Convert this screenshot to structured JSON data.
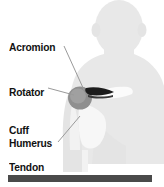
{
  "figure": {
    "background_color": "#ffffff",
    "width": 164,
    "height": 187
  },
  "labels": {
    "acromion": "Acromion",
    "rotator_cuff_tendon_line1": "Rotator",
    "rotator_cuff_tendon_line2": "Cuff",
    "rotator_cuff_tendon_line3": "Tendon",
    "humerus": "Humerus"
  },
  "colors": {
    "text": "#111111",
    "body_silhouette": "#e8e8e8",
    "body_silhouette_shadow": "#dcdcdc",
    "humeral_head": "#8a8a8a",
    "acromion_bone": "#1c1c1c",
    "clavicle_bone": "#fbfbfb",
    "scapula_bone": "#f4f4f4",
    "leader_line": "#9a9a9a",
    "bottom_bar": "#4a4a4a"
  },
  "anatomy": [
    {
      "name": "acromion",
      "description": "dark wedge-shaped bone above the humeral head"
    },
    {
      "name": "rotator-cuff-tendon",
      "description": "tendon region at the humeral head"
    },
    {
      "name": "humerus",
      "description": "upper arm bone below the shoulder joint"
    },
    {
      "name": "clavicle",
      "description": "light collarbone extending to the right"
    },
    {
      "name": "scapula",
      "description": "light shoulder blade below the joint"
    }
  ],
  "bottom_bar": {
    "name": "bottom-rule",
    "color": "#4a4a4a"
  }
}
